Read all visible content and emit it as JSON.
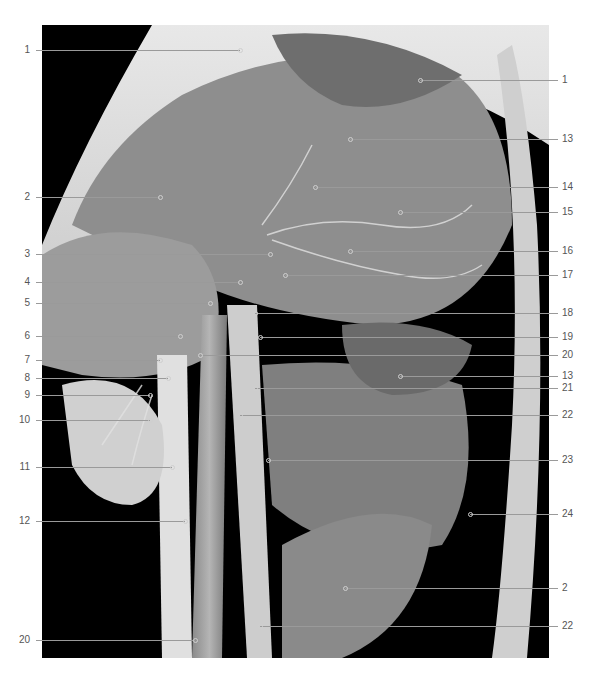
{
  "figure": {
    "caption_number": "",
    "caption_text": "",
    "labels_left": [
      {
        "text": "1",
        "y": 50,
        "x_end": 240
      },
      {
        "text": "2",
        "y": 197,
        "x_end": 160
      },
      {
        "text": "3",
        "y": 254,
        "x_end": 270
      },
      {
        "text": "4",
        "y": 282,
        "x_end": 240
      },
      {
        "text": "5",
        "y": 303,
        "x_end": 210
      },
      {
        "text": "6",
        "y": 336,
        "x_end": 180
      },
      {
        "text": "7",
        "y": 360,
        "x_end": 160
      },
      {
        "text": "8",
        "y": 378,
        "x_end": 168
      },
      {
        "text": "9",
        "y": 395,
        "x_end": 150
      },
      {
        "text": "10",
        "y": 420,
        "x_end": 150
      },
      {
        "text": "11",
        "y": 467,
        "x_end": 172
      },
      {
        "text": "12",
        "y": 521,
        "x_end": 185
      },
      {
        "text": "20",
        "y": 640,
        "x_end": 195
      }
    ],
    "labels_right": [
      {
        "text": "1",
        "y": 80,
        "x_start": 420
      },
      {
        "text": "13",
        "y": 139,
        "x_start": 350
      },
      {
        "text": "14",
        "y": 187,
        "x_start": 315
      },
      {
        "text": "15",
        "y": 212,
        "x_start": 400
      },
      {
        "text": "16",
        "y": 251,
        "x_start": 350
      },
      {
        "text": "17",
        "y": 275,
        "x_start": 285
      },
      {
        "text": "18",
        "y": 313,
        "x_start": 255
      },
      {
        "text": "19",
        "y": 337,
        "x_start": 260
      },
      {
        "text": "20",
        "y": 355,
        "x_start": 200
      },
      {
        "text": "13",
        "y": 376,
        "x_start": 400
      },
      {
        "text": "21",
        "y": 388,
        "x_start": 255
      },
      {
        "text": "22",
        "y": 415,
        "x_start": 240
      },
      {
        "text": "23",
        "y": 460,
        "x_start": 268
      },
      {
        "text": "24",
        "y": 514,
        "x_start": 470
      },
      {
        "text": "2",
        "y": 588,
        "x_start": 345
      },
      {
        "text": "22",
        "y": 626,
        "x_start": 260
      }
    ]
  },
  "colors": {
    "background": "#ffffff",
    "photo_bg": "#000000",
    "leader_line": "#9a9a9a",
    "label_text": "#555555"
  }
}
